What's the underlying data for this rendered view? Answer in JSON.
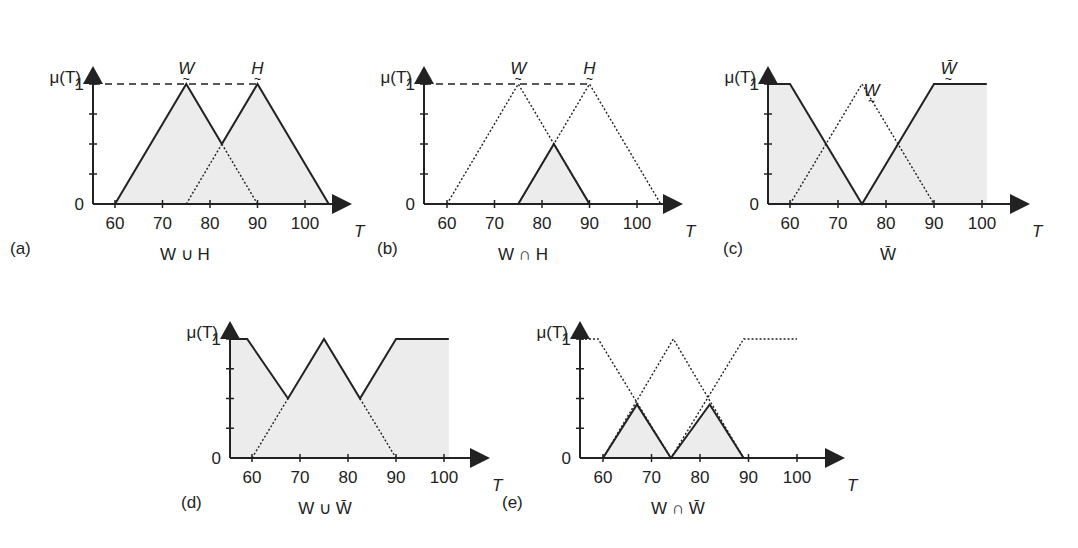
{
  "figure": {
    "fill_color": "#ececec",
    "line_color": "#222222",
    "y_axis_label": "μ(T)",
    "x_axis_label": "T",
    "y_ticks": [
      "0",
      "1"
    ],
    "x_ticks": [
      "60",
      "70",
      "80",
      "90",
      "100"
    ]
  },
  "chart_data": [
    {
      "id": "a",
      "type": "line",
      "panel_letter": "(a)",
      "title": "W ∪ H",
      "caption_parts": [
        "W",
        "∪",
        "H"
      ],
      "xlabel": "T",
      "ylabel": "μ(T)",
      "x_ticks": [
        60,
        70,
        80,
        90,
        100
      ],
      "y_ticks": [
        0,
        1
      ],
      "xlim": [
        55,
        106
      ],
      "ylim": [
        0,
        1
      ],
      "reference_line": {
        "y": 1,
        "x_from": 55,
        "x_to": 90,
        "style": "dashed"
      },
      "set_labels": [
        {
          "text": "W",
          "x": 75
        },
        {
          "text": "H",
          "x": 90
        }
      ],
      "series": [
        {
          "name": "W",
          "style": "solid",
          "x": [
            60,
            75,
            82.5
          ],
          "y": [
            0,
            1,
            0.5
          ]
        },
        {
          "name": "W (hidden part)",
          "style": "dotted",
          "x": [
            82.5,
            90
          ],
          "y": [
            0.5,
            0
          ]
        },
        {
          "name": "H",
          "style": "solid",
          "x": [
            82.5,
            90,
            105
          ],
          "y": [
            0.5,
            1,
            0
          ]
        },
        {
          "name": "H (hidden part)",
          "style": "dotted",
          "x": [
            75,
            82.5
          ],
          "y": [
            0,
            0.5
          ]
        }
      ],
      "shaded_region": {
        "name": "W ∪ H",
        "x": [
          60,
          75,
          82.5,
          90,
          105
        ],
        "y": [
          0,
          1,
          0.5,
          1,
          0
        ]
      }
    },
    {
      "id": "b",
      "type": "line",
      "panel_letter": "(b)",
      "title": "W ∩ H",
      "caption_parts": [
        "W",
        "∩",
        "H"
      ],
      "xlabel": "T",
      "ylabel": "μ(T)",
      "x_ticks": [
        60,
        70,
        80,
        90,
        100
      ],
      "y_ticks": [
        0,
        1
      ],
      "xlim": [
        55,
        106
      ],
      "ylim": [
        0,
        1
      ],
      "reference_line": {
        "y": 1,
        "x_from": 55,
        "x_to": 90,
        "style": "dashed"
      },
      "set_labels": [
        {
          "text": "W",
          "x": 75
        },
        {
          "text": "H",
          "x": 90
        }
      ],
      "series": [
        {
          "name": "W",
          "style": "dotted",
          "x": [
            60,
            75,
            90
          ],
          "y": [
            0,
            1,
            0
          ]
        },
        {
          "name": "H",
          "style": "dotted",
          "x": [
            75,
            90,
            105
          ],
          "y": [
            0,
            1,
            0
          ]
        },
        {
          "name": "W ∩ H",
          "style": "solid",
          "x": [
            75,
            82.5,
            90
          ],
          "y": [
            0,
            0.5,
            0
          ]
        }
      ],
      "shaded_region": {
        "name": "W ∩ H",
        "x": [
          75,
          82.5,
          90
        ],
        "y": [
          0,
          0.5,
          0
        ]
      }
    },
    {
      "id": "c",
      "type": "line",
      "panel_letter": "(c)",
      "title": "W̄",
      "caption_parts": [
        "W̄"
      ],
      "xlabel": "T",
      "ylabel": "μ(T)",
      "x_ticks": [
        60,
        70,
        80,
        90,
        100
      ],
      "y_ticks": [
        0,
        1
      ],
      "xlim": [
        55,
        106
      ],
      "ylim": [
        0,
        1
      ],
      "set_labels": [
        {
          "text": "W",
          "x": 77
        },
        {
          "text": "W̄",
          "x": 93
        }
      ],
      "series": [
        {
          "name": "W",
          "style": "dotted",
          "x": [
            60,
            75,
            90
          ],
          "y": [
            0,
            1,
            0
          ]
        },
        {
          "name": "W̄ (complement)",
          "style": "solid",
          "x": [
            55,
            60,
            75,
            90,
            101
          ],
          "y": [
            1,
            1,
            0,
            1,
            1
          ]
        }
      ],
      "shaded_region": {
        "name": "W̄",
        "x": [
          55,
          60,
          75,
          90,
          101
        ],
        "y": [
          1,
          1,
          0,
          1,
          1
        ]
      }
    },
    {
      "id": "d",
      "type": "line",
      "panel_letter": "(d)",
      "title": "W ∪ W̄",
      "caption_parts": [
        "W",
        "∪",
        "W̄"
      ],
      "xlabel": "T",
      "ylabel": "μ(T)",
      "x_ticks": [
        60,
        70,
        80,
        90,
        100
      ],
      "y_ticks": [
        0,
        1
      ],
      "xlim": [
        55,
        106
      ],
      "ylim": [
        0,
        1
      ],
      "series": [
        {
          "name": "W ∪ W̄",
          "style": "solid",
          "x": [
            55,
            59,
            67.5,
            75,
            82.5,
            90,
            101
          ],
          "y": [
            1,
            1,
            0.5,
            1,
            0.5,
            1,
            1
          ]
        },
        {
          "name": "W (hidden part)",
          "style": "dotted",
          "x": [
            60,
            67.5
          ],
          "y": [
            0,
            0.5
          ]
        },
        {
          "name": "W (hidden part)",
          "style": "dotted",
          "x": [
            82.5,
            90
          ],
          "y": [
            0.5,
            0
          ]
        }
      ],
      "shaded_region": {
        "name": "W ∪ W̄",
        "x": [
          55,
          59,
          67.5,
          75,
          82.5,
          90,
          101
        ],
        "y": [
          1,
          1,
          0.5,
          1,
          0.5,
          1,
          1
        ]
      }
    },
    {
      "id": "e",
      "type": "line",
      "panel_letter": "(e)",
      "title": "W ∩ W̄",
      "caption_parts": [
        "W",
        "∩",
        "W̄"
      ],
      "xlabel": "T",
      "ylabel": "μ(T)",
      "x_ticks": [
        60,
        70,
        80,
        90,
        100
      ],
      "y_ticks": [
        0,
        1
      ],
      "xlim": [
        55,
        106
      ],
      "ylim": [
        0,
        1
      ],
      "series": [
        {
          "name": "W̄ (complement)",
          "style": "dotted",
          "x": [
            55,
            59,
            74,
            89,
            100
          ],
          "y": [
            1,
            1,
            0,
            1,
            1
          ]
        },
        {
          "name": "W",
          "style": "dotted",
          "x": [
            60,
            74.5,
            89
          ],
          "y": [
            0,
            1,
            0
          ]
        },
        {
          "name": "W ∩ W̄",
          "style": "solid",
          "x": [
            55,
            60,
            67,
            74,
            82,
            89
          ],
          "y": [
            0,
            0,
            0.45,
            0,
            0.45,
            0
          ]
        }
      ],
      "shaded_region": {
        "name": "W ∩ W̄",
        "x": [
          60,
          67,
          74,
          82,
          89
        ],
        "y": [
          0,
          0.45,
          0,
          0.45,
          0
        ]
      }
    }
  ],
  "layout": {
    "panels": {
      "a": {
        "axis_x": 93,
        "x0_px": 115,
        "px_per_unit": 4.75,
        "y0_px": 204,
        "y1_px": 84,
        "arrow_end": 352,
        "axis_top": 66,
        "xlabel_y": 234,
        "letter_x": 10,
        "caption_x": 185
      },
      "b": {
        "axis_x": 424,
        "x0_px": 447,
        "px_per_unit": 4.75,
        "y0_px": 204,
        "y1_px": 84,
        "arrow_end": 683,
        "axis_top": 66,
        "xlabel_y": 234,
        "letter_x": 377,
        "caption_x": 523
      },
      "c": {
        "axis_x": 768,
        "x0_px": 790,
        "px_per_unit": 4.8,
        "y0_px": 204,
        "y1_px": 84,
        "arrow_end": 1030,
        "axis_top": 66,
        "xlabel_y": 234,
        "letter_x": 723,
        "caption_x": 888
      },
      "d": {
        "axis_x": 230,
        "x0_px": 252,
        "px_per_unit": 4.8,
        "y0_px": 458,
        "y1_px": 339,
        "arrow_end": 490,
        "axis_top": 321,
        "xlabel_y": 488,
        "letter_x": 181,
        "caption_x": 325
      },
      "e": {
        "axis_x": 580,
        "x0_px": 603,
        "px_per_unit": 4.85,
        "y0_px": 458,
        "y1_px": 339,
        "arrow_end": 845,
        "axis_top": 321,
        "xlabel_y": 488,
        "letter_x": 502,
        "caption_x": 678
      }
    }
  }
}
